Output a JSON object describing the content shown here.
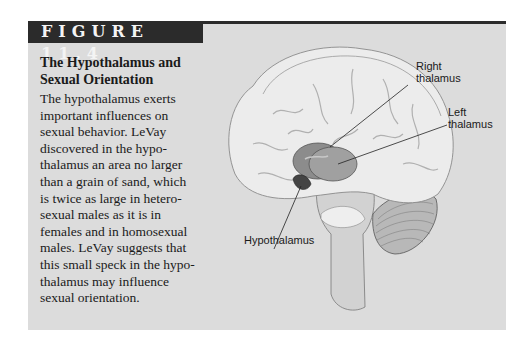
{
  "figure": {
    "label": "FIGURE 11.4",
    "title_lines": [
      "The Hypothalamus and",
      "Sexual Orientation"
    ],
    "caption_lines": [
      "The hypothalamus exerts",
      "important influences on",
      "sexual behavior. LeVay",
      "discovered in the hypo-",
      "thalamus an area no larger",
      "than a grain of sand, which",
      "is twice as large in hetero-",
      "sexual males as it is in",
      "females and in homosexual",
      "males. LeVay suggests that",
      "this small speck in the hypo-",
      "thalamus may influence",
      "sexual orientation."
    ]
  },
  "illustration": {
    "annotations": {
      "right_thalamus": [
        "Right",
        "thalamus"
      ],
      "left_thalamus": [
        "Left",
        "thalamus"
      ],
      "hypothalamus": "Hypothalamus"
    }
  },
  "colors": {
    "header_bar": "#2b2b2b",
    "panel_background": "#dcdcdc",
    "brain_fill": "#ececec",
    "thalamus_fill": "#8c8c8c"
  }
}
